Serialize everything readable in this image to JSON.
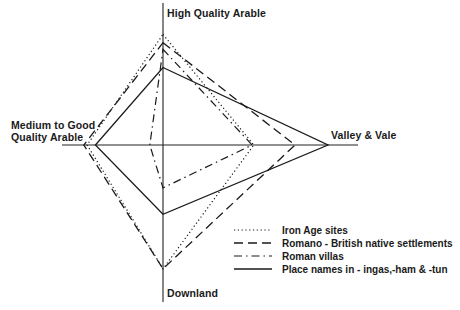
{
  "chart_data": {
    "type": "radar",
    "title": "",
    "axes": [
      {
        "key": "top",
        "label_lines": [
          "High Quality Arable"
        ]
      },
      {
        "key": "right",
        "label_lines": [
          "Valley & Vale"
        ]
      },
      {
        "key": "bottom",
        "label_lines": [
          "Downland"
        ]
      },
      {
        "key": "left",
        "label_lines": [
          "Medium to Good",
          "Quality Arable"
        ]
      }
    ],
    "scale": "relative (fraction of maximum axis extent)",
    "series": [
      {
        "name": "Iron Age sites",
        "style": "dotted",
        "values": {
          "top": 0.67,
          "right": 0.55,
          "bottom": 0.75,
          "left": 0.46
        }
      },
      {
        "name": "Romano - British native settlements",
        "style": "dashed",
        "values": {
          "top": 0.62,
          "right": 0.8,
          "bottom": 0.75,
          "left": 0.48
        }
      },
      {
        "name": "Roman villas",
        "style": "dash-dot",
        "values": {
          "top": 0.58,
          "right": 0.54,
          "bottom": 0.26,
          "left": 0.08
        }
      },
      {
        "name": "Place names in - ingas,-ham & -tun",
        "style": "solid",
        "values": {
          "top": 0.47,
          "right": 1.0,
          "bottom": 0.42,
          "left": 0.41
        }
      }
    ],
    "legend": {
      "placement": "bottom-right",
      "entries": [
        "Iron Age sites",
        "Romano - British native settlements",
        "Roman villas",
        "Place names in - ingas,-ham & -tun"
      ]
    },
    "colors": {
      "ink": "#1a1a1a",
      "background": "#ffffff"
    }
  }
}
